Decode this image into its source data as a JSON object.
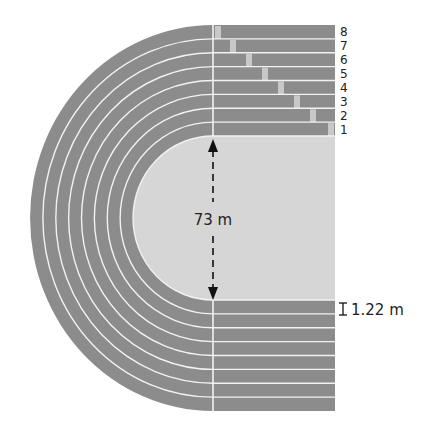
{
  "diagram": {
    "lane_count": 8,
    "lane_labels": [
      "1",
      "2",
      "3",
      "4",
      "5",
      "6",
      "7",
      "8"
    ],
    "dimensions": {
      "field_width_label": "73 m",
      "lane_width_label": "1.22 m"
    },
    "colors": {
      "track": "#8c8c8c",
      "field": "#d6d6d6",
      "lines": "#f2f2f2",
      "start_marker": "#c8c8c8",
      "text": "#222222"
    }
  }
}
